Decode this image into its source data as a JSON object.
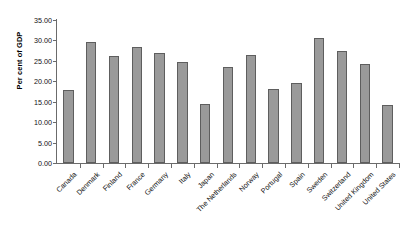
{
  "chart_data": {
    "type": "bar",
    "title": "",
    "xlabel": "",
    "ylabel": "Per cent of GDP",
    "ylim": [
      0,
      35
    ],
    "ytick_step": 5,
    "ytick_labels": [
      "35.00",
      "30.00",
      "25.00",
      "20.00",
      "15.00",
      "10.00",
      "5.00",
      "0.00"
    ],
    "ytick_values": [
      35,
      30,
      25,
      20,
      15,
      10,
      5,
      0
    ],
    "grid": false,
    "legend": "none",
    "bar_color": "#9a9a9a",
    "bar_edge_color": "#5e5e5e",
    "axis_color": "#6b6b6b",
    "categories": [
      "Canada",
      "Denmark",
      "Finland",
      "France",
      "Germany",
      "Italy",
      "Japan",
      "The Netherlands",
      "Norway",
      "Portugal",
      "Spain",
      "Sweden",
      "Switzerland",
      "United Kingdom",
      "United States"
    ],
    "values": [
      17.9,
      29.5,
      26.3,
      28.4,
      26.9,
      24.8,
      14.5,
      23.6,
      26.4,
      18.0,
      19.5,
      30.5,
      27.5,
      24.2,
      14.3
    ]
  }
}
